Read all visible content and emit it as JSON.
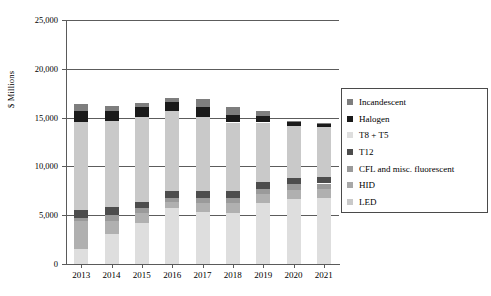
{
  "chart_data": {
    "type": "bar",
    "stacked": true,
    "title": "",
    "subtitle": "",
    "xlabel": "",
    "ylabel": "$ Millions",
    "categories": [
      "2013",
      "2014",
      "2015",
      "2016",
      "2017",
      "2018",
      "2019",
      "2020",
      "2021"
    ],
    "ylim": [
      0,
      25000
    ],
    "yticks": [
      0,
      5000,
      10000,
      15000,
      20000,
      25000
    ],
    "ytick_labels": [
      "0",
      "5,000",
      "10,000",
      "15,000",
      "20,000",
      "25,000"
    ],
    "grid": true,
    "grid_axis": "y",
    "legend_position": "right",
    "series": [
      {
        "name": "LED",
        "color": "#dedede",
        "values": [
          1500,
          3100,
          4200,
          5700,
          5350,
          5250,
          6250,
          6700,
          6750
        ]
      },
      {
        "name": "CFL and misc. fluorescent",
        "color": "#b0b0b0",
        "values": [
          2900,
          1350,
          1000,
          650,
          950,
          1000,
          900,
          850,
          900
        ]
      },
      {
        "name": "HID",
        "color": "#9a9a9a",
        "values": [
          300,
          550,
          500,
          400,
          500,
          550,
          550,
          600,
          600
        ]
      },
      {
        "name": "T12",
        "color": "#4d4d4d",
        "values": [
          800,
          850,
          700,
          700,
          700,
          700,
          700,
          700,
          700
        ]
      },
      {
        "name": "T8 + T5",
        "color": "#c9c9c9",
        "values": [
          9100,
          8800,
          8700,
          8200,
          7600,
          7000,
          6100,
          5300,
          5100
        ]
      },
      {
        "name": "Halogen",
        "color": "#1a1a1a",
        "values": [
          1100,
          1050,
          1000,
          1000,
          950,
          750,
          650,
          400,
          300
        ]
      },
      {
        "name": "Incandescent",
        "color": "#7e7e7e",
        "values": [
          700,
          450,
          400,
          350,
          900,
          800,
          550,
          100,
          100
        ]
      }
    ],
    "totals": [
      16400,
      16150,
      16500,
      17000,
      16950,
      16050,
      15700,
      14650,
      14450
    ],
    "stack_order_bottom_to_top": [
      "LED",
      "CFL and misc. fluorescent",
      "HID",
      "T12",
      "T8 + T5",
      "Halogen",
      "Incandescent"
    ]
  },
  "legend": {
    "entries": [
      {
        "label": "Incandescent",
        "color": "#7e7e7e"
      },
      {
        "label": "Halogen",
        "color": "#1a1a1a"
      },
      {
        "label": "T8 + T5",
        "color": "#dedede"
      },
      {
        "label": "T12",
        "color": "#4d4d4d"
      },
      {
        "label": "CFL and misc. fluorescent",
        "color": "#9a9a9a"
      },
      {
        "label": "HID",
        "color": "#a8a8a8"
      },
      {
        "label": "LED",
        "color": "#c9c9c9"
      }
    ]
  }
}
